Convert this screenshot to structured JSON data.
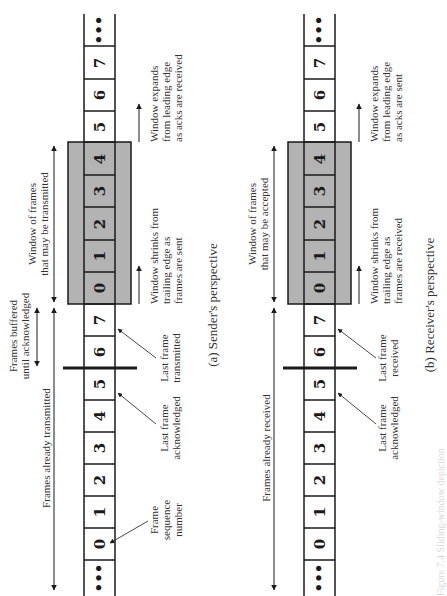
{
  "figure": {
    "caption": "Figure 7.4 Sliding-window depiction",
    "colors": {
      "window_fill": "#b3b3b3",
      "line": "#1a1a1a",
      "background": "#ffffff"
    }
  },
  "sender": {
    "caption": "(a) Sender's perspective",
    "ellipsis_top": "•••",
    "ellipsis_bottom": "•••",
    "frames_top": [
      "7",
      "6",
      "5"
    ],
    "window_frames": [
      "4",
      "3",
      "2",
      "1",
      "0"
    ],
    "frames_mid": [
      "7",
      "6",
      "5",
      "4",
      "3",
      "2",
      "1",
      "0"
    ],
    "labels": {
      "window_line1": "Window of frames",
      "window_line2": "that may be transmitted",
      "buffered_line1": "Frames buffered",
      "buffered_line2": "until acknowledged",
      "already": "Frames already transmitted",
      "expands_line1": "Window expands",
      "expands_line2": "from leading edge",
      "expands_line3": "as acks are received",
      "shrinks_line1": "Window shrinks from",
      "shrinks_line2": "trailing edge as",
      "shrinks_line3": "frames are sent",
      "last_tx_line1": "Last frame",
      "last_tx_line2": "transmitted",
      "last_ack_line1": "Last frame",
      "last_ack_line2": "acknowledged",
      "seq_line1": "Frame",
      "seq_line2": "sequence",
      "seq_line3": "number"
    }
  },
  "receiver": {
    "caption": "(b) Receiver's perspective",
    "ellipsis_top": "•••",
    "ellipsis_bottom": "•••",
    "frames_top": [
      "7",
      "6",
      "5"
    ],
    "window_frames": [
      "4",
      "3",
      "2",
      "1",
      "0"
    ],
    "frames_mid": [
      "7",
      "6",
      "5",
      "4",
      "3",
      "2",
      "1",
      "0"
    ],
    "labels": {
      "window_line1": "Window of frames",
      "window_line2": "that may be accepted",
      "already": "Frames already received",
      "expands_line1": "Window expands",
      "expands_line2": "from leading edge",
      "expands_line3": "as acks are sent",
      "shrinks_line1": "Window shrinks from",
      "shrinks_line2": "trailing edge as",
      "shrinks_line3": "frames are received",
      "last_rx_line1": "Last frame",
      "last_rx_line2": "received",
      "last_ack_line1": "Last frame",
      "last_ack_line2": "acknowledged"
    }
  }
}
